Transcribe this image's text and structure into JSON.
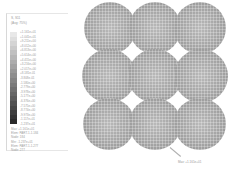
{
  "legend": {
    "title": "S, S11",
    "subtitle": "(Avg: 75%)",
    "extra": "",
    "values": [
      "+1.161e+01",
      "+1.041e+01",
      "+9.211e+00",
      "+8.012e+00",
      "+6.813e+00",
      "+5.614e+00",
      "+4.415e+00",
      "+3.216e+00",
      "+2.017e+00",
      "+8.181e-01",
      "-3.808e-01",
      "-1.580e+00",
      "-2.779e+00",
      "-3.978e+00",
      "-5.177e+00",
      "-6.376e+00",
      "-7.575e+00",
      "-8.774e+00",
      "-9.973e+00",
      "-1.117e+01",
      "-1.237e+01"
    ],
    "colors": [
      "#e8e8e8",
      "#dedede",
      "#d4d4d4",
      "#cacaca",
      "#c0c0c0",
      "#b6b6b6",
      "#acacac",
      "#a2a2a2",
      "#989898",
      "#8e8e8e",
      "#848484",
      "#7a7a7a",
      "#707070",
      "#666666",
      "#5c5c5c",
      "#525252",
      "#484848",
      "#3e3e3e",
      "#343434",
      "#2a2a2a"
    ],
    "max_line1": "Max: +1.161e+01",
    "max_line2": "Elem: PART-1-1.184",
    "max_line3": "Node: 184",
    "min_line1": "Min: -1.237e+01",
    "min_line2": "Elem: PART-1-1.277",
    "min_line3": "Node: 277"
  },
  "plot": {
    "annotation": "Max: +1.161e+01"
  }
}
